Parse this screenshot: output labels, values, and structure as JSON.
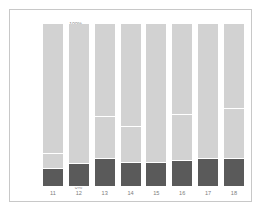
{
  "chart_data": {
    "type": "bar",
    "subtype": "stacked-100-percent",
    "title": "",
    "xlabel": "",
    "ylabel": "",
    "ylim": [
      0,
      100
    ],
    "ytick_labels": [
      "100%",
      "80%",
      "60%",
      "40%",
      "20%",
      "0%"
    ],
    "ytick_values": [
      100,
      80,
      60,
      40,
      20,
      0
    ],
    "grid": false,
    "legend": "none",
    "categories": [
      "11",
      "12",
      "13",
      "14",
      "15",
      "16",
      "17",
      "18"
    ],
    "colors": {
      "dark_segment": "#5a5a5a",
      "light_segment": "#d2d2d2",
      "divider": "#ffffff",
      "background": "#ffffff",
      "border": "#c8c8c8",
      "tick_text": "#8a8a8a"
    },
    "series": [
      {
        "name": "bottom",
        "color": "#5a5a5a",
        "values": [
          11,
          14,
          17,
          15,
          15,
          16,
          17,
          17
        ]
      },
      {
        "name": "middle-lower",
        "color": "#d2d2d2",
        "values": [
          9,
          59,
          26,
          22,
          59,
          28,
          33,
          31
        ]
      },
      {
        "name": "middle-upper",
        "color": "#d2d2d2",
        "values": [
          60,
          27,
          28,
          25,
          26,
          17,
          50,
          23
        ]
      },
      {
        "name": "top",
        "color": "#d2d2d2",
        "values": [
          20,
          0,
          29,
          38,
          0,
          39,
          0,
          29
        ]
      }
    ],
    "bars": [
      {
        "category": "11",
        "segments": [
          {
            "value": 11,
            "color": "#5a5a5a"
          },
          {
            "value": 9,
            "color": "#d2d2d2"
          },
          {
            "value": 60,
            "color": "#d2d2d2"
          },
          {
            "value": 20,
            "color": "#d2d2d2"
          }
        ]
      },
      {
        "category": "12",
        "segments": [
          {
            "value": 14,
            "color": "#5a5a5a"
          },
          {
            "value": 59,
            "color": "#d2d2d2"
          },
          {
            "value": 27,
            "color": "#d2d2d2"
          }
        ]
      },
      {
        "category": "13",
        "segments": [
          {
            "value": 17,
            "color": "#5a5a5a"
          },
          {
            "value": 26,
            "color": "#d2d2d2"
          },
          {
            "value": 28,
            "color": "#d2d2d2"
          },
          {
            "value": 29,
            "color": "#d2d2d2"
          }
        ]
      },
      {
        "category": "14",
        "segments": [
          {
            "value": 15,
            "color": "#5a5a5a"
          },
          {
            "value": 22,
            "color": "#d2d2d2"
          },
          {
            "value": 25,
            "color": "#d2d2d2"
          },
          {
            "value": 38,
            "color": "#d2d2d2"
          }
        ]
      },
      {
        "category": "15",
        "segments": [
          {
            "value": 15,
            "color": "#5a5a5a"
          },
          {
            "value": 59,
            "color": "#d2d2d2"
          },
          {
            "value": 26,
            "color": "#d2d2d2"
          }
        ]
      },
      {
        "category": "16",
        "segments": [
          {
            "value": 16,
            "color": "#5a5a5a"
          },
          {
            "value": 28,
            "color": "#d2d2d2"
          },
          {
            "value": 17,
            "color": "#d2d2d2"
          },
          {
            "value": 39,
            "color": "#d2d2d2"
          }
        ]
      },
      {
        "category": "17",
        "segments": [
          {
            "value": 17,
            "color": "#5a5a5a"
          },
          {
            "value": 33,
            "color": "#d2d2d2"
          },
          {
            "value": 50,
            "color": "#d2d2d2"
          }
        ]
      },
      {
        "category": "18",
        "segments": [
          {
            "value": 17,
            "color": "#5a5a5a"
          },
          {
            "value": 31,
            "color": "#d2d2d2"
          },
          {
            "value": 23,
            "color": "#d2d2d2"
          },
          {
            "value": 29,
            "color": "#d2d2d2"
          }
        ]
      }
    ]
  }
}
